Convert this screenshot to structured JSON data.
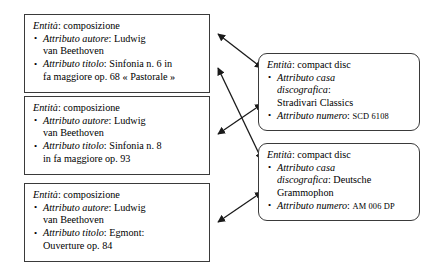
{
  "diagram": {
    "line_color": "#1a1a1a",
    "box_border_color": "#3a3a3a",
    "background_color": "#ffffff",
    "entity_label": "Entità",
    "compositions": [
      {
        "entity_type": "composizione",
        "entity_line_label": "Entità",
        "entity_line_value": ": composizione",
        "attributes": [
          {
            "label": "Attributo autore",
            "value": ": Ludwig van Beethoven",
            "line1_label": "Attributo autore",
            "line1_value": ": Ludwig",
            "line2": "van Beethoven"
          },
          {
            "label": "Attributo titolo",
            "value": ": Sinfonia n. 6 in fa maggiore op. 68 « Pastorale »",
            "line1_label": "Attributo titolo",
            "line1_value": ": Sinfonia n. 6 in",
            "line2": "fa maggiore op. 68 « Pastorale »"
          }
        ]
      },
      {
        "entity_type": "composizione",
        "entity_line_label": "Entità",
        "entity_line_value": ": composizione",
        "attributes": [
          {
            "label": "Attributo autore",
            "value": ": Ludwig van Beethoven",
            "line1_label": "Attributo autore",
            "line1_value": ": Ludwig",
            "line2": "van Beethoven"
          },
          {
            "label": "Attributo titolo",
            "value": ": Sinfonia n. 8 in fa maggiore op. 93",
            "line1_label": "Attributo titolo",
            "line1_value": ": Sinfonia n. 8",
            "line2": "in fa maggiore op. 93"
          }
        ]
      },
      {
        "entity_type": "composizione",
        "entity_line_label": "Entità",
        "entity_line_value": ": composizione",
        "attributes": [
          {
            "label": "Attributo autore",
            "value": ": Ludwig van Beethoven",
            "line1_label": "Attributo autore",
            "line1_value": ": Ludwig",
            "line2": "van Beethoven"
          },
          {
            "label": "Attributo titolo",
            "value": ": Egmont: Ouverture op. 84",
            "line1_label": "Attributo titolo",
            "line1_value": ": Egmont:",
            "line2": "Ouverture op. 84"
          }
        ]
      }
    ],
    "compact_discs": [
      {
        "entity_type": "compact disc",
        "entity_line_label": "Entità",
        "entity_line_value": ": compact disc",
        "attributes": [
          {
            "label": "Attributo casa discografica",
            "value": ": Stradivari Classics",
            "line1_label": "Attributo casa",
            "line2_label": "discografica",
            "line2_value": ":",
            "line3": "Stradivari Classics"
          },
          {
            "label": "Attributo numero",
            "value": ": SCD 6108",
            "line1_label": "Attributo numero",
            "line1_sep": ": ",
            "line1_value": "SCD 6108"
          }
        ]
      },
      {
        "entity_type": "compact disc",
        "entity_line_label": "Entità",
        "entity_line_value": ": compact disc",
        "attributes": [
          {
            "label": "Attributo casa discografica",
            "value": ": Deutsche Grammophon",
            "line1_label": "Attributo casa",
            "line2_label": "discografica",
            "line2_value": ": Deutsche",
            "line3": "Grammophon"
          },
          {
            "label": "Attributo numero",
            "value": ": AM 006 DP",
            "line1_label": "Attributo numero",
            "line1_sep": ": ",
            "line1_value": "AM 006 DP"
          }
        ]
      }
    ],
    "relationships": [
      {
        "from": "composizione-1",
        "to": "compact-disc-1",
        "style": "double-headed-arrow"
      },
      {
        "from": "composizione-1",
        "to": "compact-disc-2",
        "style": "double-headed-arrow"
      },
      {
        "from": "composizione-2",
        "to": "compact-disc-1",
        "style": "double-headed-arrow"
      },
      {
        "from": "composizione-3",
        "to": "compact-disc-2",
        "style": "double-headed-arrow"
      }
    ]
  }
}
